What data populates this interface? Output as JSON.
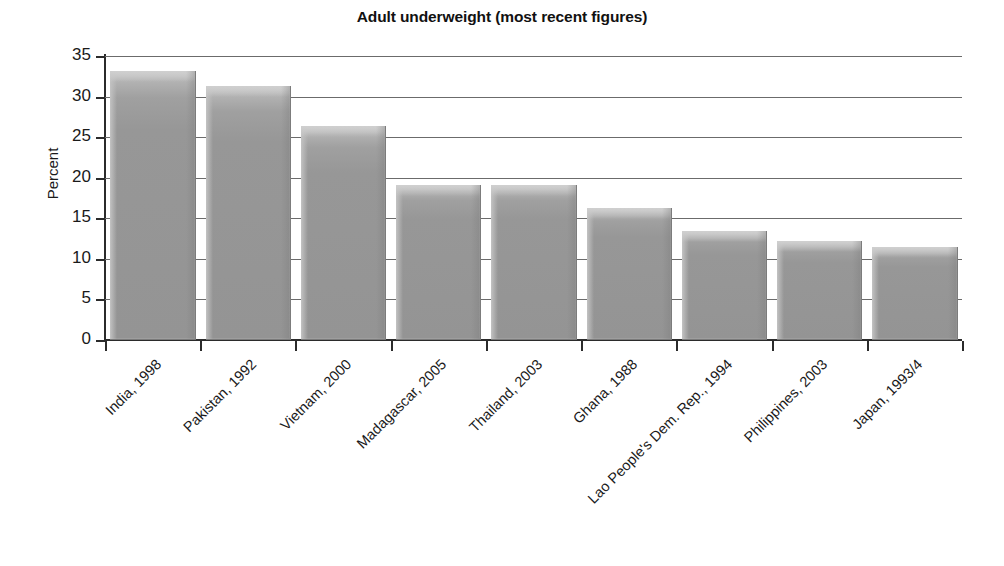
{
  "chart_data": {
    "type": "bar",
    "title": "Adult underweight (most recent figures)",
    "xlabel": "",
    "ylabel": "Percent",
    "ylim": [
      0,
      35
    ],
    "yticks": [
      0,
      5,
      10,
      15,
      20,
      25,
      30,
      35
    ],
    "grid": true,
    "legend": false,
    "categories": [
      "India, 1998",
      "Pakistan, 1992",
      "Vietnam, 2000",
      "Madagascar, 2005",
      "Thailand, 2003",
      "Ghana, 1988",
      "Lao People's Dem. Rep., 1994",
      "Philippines, 2003",
      "Japan, 1993/4"
    ],
    "values": [
      33,
      31.2,
      26.2,
      19,
      19,
      16.2,
      13.3,
      12.1,
      11.3
    ],
    "bar_color": "#9a9a9a",
    "axis_color": "#2b2b2b",
    "gridline_color": "#6b6b6b"
  }
}
